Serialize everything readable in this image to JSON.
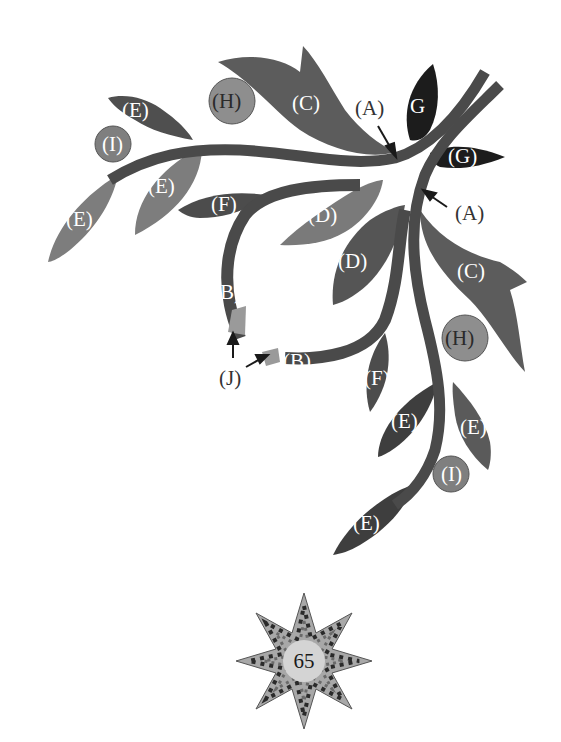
{
  "diagram": {
    "colors": {
      "stem": "#4a4a4a",
      "leaf_c": "#5c5c5c",
      "leaf_d_light": "#7a7a7a",
      "leaf_d_dark": "#555555",
      "leaf_e_light": "#7d7d7d",
      "leaf_e_dark": "#3e3e3e",
      "leaf_f": "#4c4c4c",
      "leaf_g": "#1c1c1c",
      "berry_h": "#8e8e8e",
      "berry_i": "#7f7f7f",
      "bud_j": "#9a9a9a",
      "label_light": "#ffffff",
      "label_dark": "#2a2a2a"
    },
    "labels": {
      "a1": "(A)",
      "a2": "(A)",
      "b1": "(B)",
      "b2": "(B)",
      "c1": "(C)",
      "c2": "(C)",
      "d1": "(D)",
      "d2": "(D)",
      "e1": "(E)",
      "e2": "(E)",
      "e3": "(E)",
      "e4": "(E)",
      "e5": "(E)",
      "e6": "(E)",
      "f1": "(F)",
      "f2": "(F)",
      "g1": "G",
      "g2": "(G)",
      "h1": "(H)",
      "h2": "(H)",
      "i1": "(I)",
      "i2": "(I)",
      "j": "(J)"
    },
    "legend": {
      "A": "stem",
      "B": "bud stem",
      "C": "large curved leaf",
      "D": "medium leaf",
      "E": "small leaf",
      "F": "narrow leaf",
      "G": "dark leaf",
      "H": "large berry",
      "I": "small berry",
      "J": "bud tip"
    }
  },
  "page": {
    "number": "65",
    "badge_icon": "lone-star-icon"
  }
}
